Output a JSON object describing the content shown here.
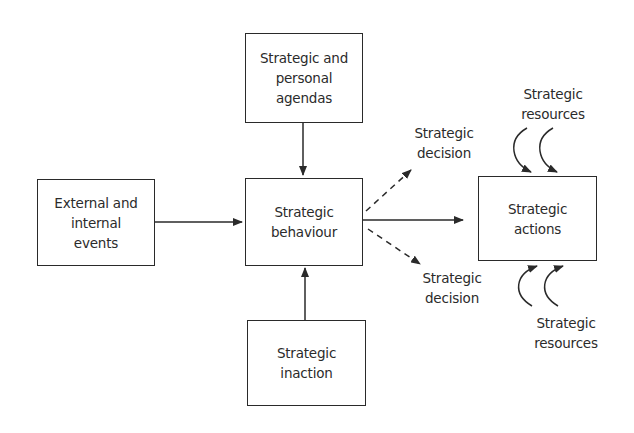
{
  "diagram": {
    "nodes": {
      "agendas": {
        "label": "Strategic and\npersonal\nagendas"
      },
      "events": {
        "label": "External and\ninternal\nevents"
      },
      "behaviour": {
        "label": "Strategic\nbehaviour"
      },
      "inaction": {
        "label": "Strategic\ninaction"
      },
      "actions": {
        "label": "Strategic\nactions"
      }
    },
    "labels": {
      "decision_top": "Strategic\ndecision",
      "decision_bottom": "Strategic\ndecision",
      "resources_top": "Strategic\nresources",
      "resources_bottom": "Strategic\nresources"
    },
    "edges": [
      {
        "from": "events",
        "to": "behaviour",
        "style": "solid"
      },
      {
        "from": "agendas",
        "to": "behaviour",
        "style": "solid"
      },
      {
        "from": "inaction",
        "to": "behaviour",
        "style": "solid"
      },
      {
        "from": "behaviour",
        "to": "actions",
        "style": "solid"
      },
      {
        "from": "behaviour",
        "to": "decision_top",
        "style": "dashed"
      },
      {
        "from": "behaviour",
        "to": "decision_bottom",
        "style": "dashed"
      },
      {
        "from": "resources_top",
        "to": "actions",
        "style": "curved",
        "count": 2
      },
      {
        "from": "resources_bottom",
        "to": "actions",
        "style": "curved",
        "count": 2
      }
    ]
  }
}
